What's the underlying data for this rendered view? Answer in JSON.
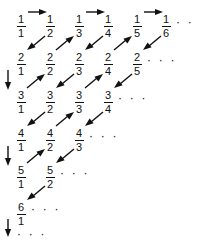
{
  "figure": {
    "name": "cantor-diagonal-enumeration-of-rationals",
    "ink_color": "#111111",
    "background_color": "#ffffff",
    "ellipsis": "· · ·",
    "rows": [
      {
        "numerator": "1",
        "cells": [
          {
            "num": "1",
            "den": "1"
          },
          {
            "num": "1",
            "den": "2"
          },
          {
            "num": "1",
            "den": "3"
          },
          {
            "num": "1",
            "den": "4"
          },
          {
            "num": "1",
            "den": "5"
          },
          {
            "num": "1",
            "den": "6"
          }
        ],
        "trailing_dots": "· · ·"
      },
      {
        "numerator": "2",
        "cells": [
          {
            "num": "2",
            "den": "1"
          },
          {
            "num": "2",
            "den": "2"
          },
          {
            "num": "2",
            "den": "3"
          },
          {
            "num": "2",
            "den": "4"
          },
          {
            "num": "2",
            "den": "5"
          }
        ],
        "trailing_dots": "· · ·"
      },
      {
        "numerator": "3",
        "cells": [
          {
            "num": "3",
            "den": "1"
          },
          {
            "num": "3",
            "den": "2"
          },
          {
            "num": "3",
            "den": "3"
          },
          {
            "num": "3",
            "den": "4"
          }
        ],
        "trailing_dots": "· · ·"
      },
      {
        "numerator": "4",
        "cells": [
          {
            "num": "4",
            "den": "1"
          },
          {
            "num": "4",
            "den": "2"
          },
          {
            "num": "4",
            "den": "3"
          }
        ],
        "trailing_dots": "· · ·"
      },
      {
        "numerator": "5",
        "cells": [
          {
            "num": "5",
            "den": "1"
          },
          {
            "num": "5",
            "den": "2"
          }
        ],
        "trailing_dots": "· · ·"
      },
      {
        "numerator": "6",
        "cells": [
          {
            "num": "6",
            "den": "1"
          }
        ],
        "trailing_dots": "· · ·"
      }
    ],
    "bottom_dots": "· · ·",
    "arrows": {
      "horizontal": [
        {
          "from": "1/1",
          "to": "1/2",
          "direction": "right"
        },
        {
          "from": "1/3",
          "to": "1/4",
          "direction": "right"
        },
        {
          "from": "1/5",
          "to": "1/6",
          "direction": "right"
        }
      ],
      "vertical": [
        {
          "from": "2/1",
          "to": "3/1",
          "direction": "down"
        },
        {
          "from": "4/1",
          "to": "5/1",
          "direction": "down"
        },
        {
          "from": "6/1",
          "to": "next-row",
          "direction": "down"
        }
      ],
      "diagonal": [
        {
          "from": "1/2",
          "to": "2/1",
          "direction": "down-left"
        },
        {
          "from": "2/2",
          "to": "1/3",
          "direction": "up-right"
        },
        {
          "from": "1/4",
          "to": "2/3",
          "direction": "down-left"
        },
        {
          "from": "2/4",
          "to": "1/5",
          "direction": "up-right"
        },
        {
          "from": "1/6",
          "to": "2/5",
          "direction": "down-left"
        },
        {
          "from": "3/1",
          "to": "2/2",
          "direction": "up-right"
        },
        {
          "from": "2/3",
          "to": "3/2",
          "direction": "down-left"
        },
        {
          "from": "3/3",
          "to": "2/4",
          "direction": "up-right"
        },
        {
          "from": "3/2",
          "to": "4/1",
          "direction": "down-left"
        },
        {
          "from": "4/2",
          "to": "3/3",
          "direction": "up-right"
        },
        {
          "from": "3/4",
          "to": "4/3",
          "direction": "down-left"
        },
        {
          "from": "5/1",
          "to": "4/2",
          "direction": "up-right"
        },
        {
          "from": "4/3",
          "to": "5/2",
          "direction": "down-left"
        },
        {
          "from": "5/2",
          "to": "6/1",
          "direction": "down-left"
        }
      ]
    }
  }
}
